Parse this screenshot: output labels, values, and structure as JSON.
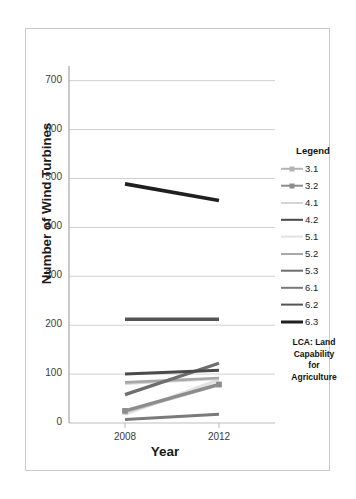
{
  "chart_data": {
    "type": "line",
    "title": "",
    "xlabel": "Year",
    "ylabel": "Number of Wind Turbines",
    "categories": [
      "2008",
      "2012"
    ],
    "x": [
      2008,
      2012
    ],
    "xtick_labels": [
      "2008",
      "2012"
    ],
    "ytick_labels": [
      "0",
      "100",
      "200",
      "300",
      "400",
      "500",
      "600",
      "700"
    ],
    "yticks": [
      0,
      100,
      200,
      300,
      400,
      500,
      600,
      700
    ],
    "ylim": [
      0,
      730
    ],
    "grid": "horizontal",
    "legend_position": "right",
    "legend_title": "Legend",
    "legend_caption_lines": [
      "LCA: Land",
      "Capability",
      "for",
      "Agriculture"
    ],
    "series": [
      {
        "name": "3.1",
        "values": [
          23,
          78
        ],
        "color": "#b4b4b4",
        "width": 3.0,
        "marker": "square"
      },
      {
        "name": "3.2",
        "values": [
          25,
          79
        ],
        "color": "#8c8c8c",
        "width": 3.2,
        "marker": "square"
      },
      {
        "name": "4.1",
        "values": [
          80,
          90
        ],
        "color": "#d6d6d6",
        "width": 2.2,
        "marker": "none"
      },
      {
        "name": "4.2",
        "values": [
          100,
          108
        ],
        "color": "#4a4a4a",
        "width": 3.0,
        "marker": "none"
      },
      {
        "name": "5.1",
        "values": [
          18,
          88
        ],
        "color": "#e2e2e2",
        "width": 3.4,
        "marker": "none"
      },
      {
        "name": "5.2",
        "values": [
          83,
          92
        ],
        "color": "#a8a8a8",
        "width": 2.6,
        "marker": "none"
      },
      {
        "name": "5.3",
        "values": [
          58,
          122
        ],
        "color": "#6e6e6e",
        "width": 3.2,
        "marker": "none"
      },
      {
        "name": "6.1",
        "values": [
          7,
          18
        ],
        "color": "#7a7a7a",
        "width": 3.0,
        "marker": "none"
      },
      {
        "name": "6.2",
        "values": [
          212,
          212
        ],
        "color": "#555555",
        "width": 3.4,
        "marker": "none"
      },
      {
        "name": "6.3",
        "values": [
          489,
          455
        ],
        "color": "#1f1f1f",
        "width": 3.6,
        "marker": "none"
      }
    ]
  }
}
